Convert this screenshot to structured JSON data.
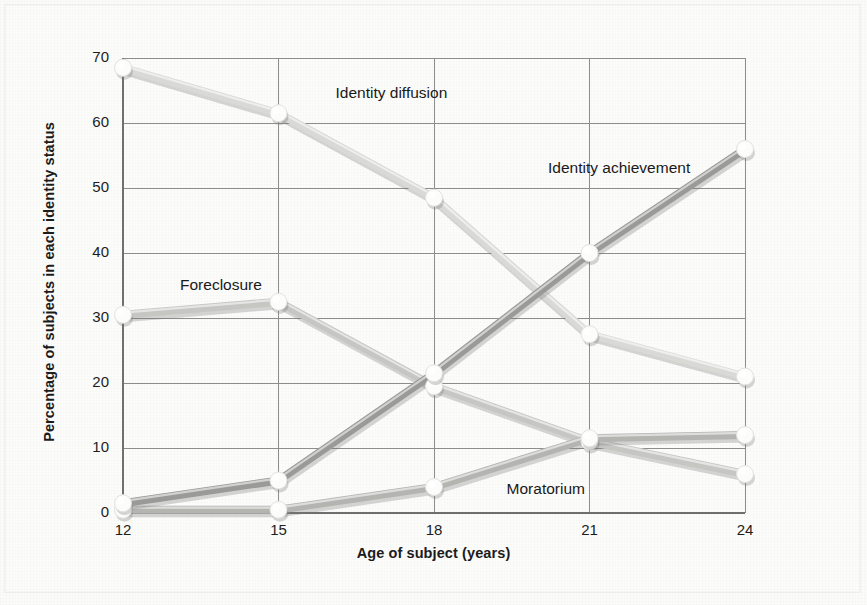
{
  "figure": {
    "background_color": "#fbfbfa",
    "ink_color": "#1b1b1b"
  },
  "axes": {
    "y_title": "Percentage of subjects in each identity status",
    "x_title": "Age of subject (years)",
    "y_ticks": [
      "0",
      "10",
      "20",
      "30",
      "40",
      "50",
      "60",
      "70"
    ],
    "x_ticks": [
      "12",
      "15",
      "18",
      "21",
      "24"
    ]
  },
  "labels": {
    "identity_diffusion": "Identity diffusion",
    "identity_achievement": "Identity achievement",
    "foreclosure": "Foreclosure",
    "moratorium": "Moratorium"
  },
  "chart_data": {
    "type": "line",
    "title": "",
    "xlabel": "Age of subject (years)",
    "ylabel": "Percentage of subjects in each identity status",
    "x": [
      12,
      15,
      18,
      21,
      24
    ],
    "xlim": [
      12,
      24
    ],
    "ylim": [
      0,
      70
    ],
    "yticks": [
      0,
      10,
      20,
      30,
      40,
      50,
      60,
      70
    ],
    "xticks": [
      12,
      15,
      18,
      21,
      24
    ],
    "grid": true,
    "legend": "inline-annotations",
    "markers": "white circle",
    "series": [
      {
        "name": "Identity diffusion",
        "color": "#d9d9d6",
        "values": [
          68.5,
          61.5,
          48.5,
          27.5,
          21.0
        ]
      },
      {
        "name": "Identity achievement",
        "color": "#9a9a99",
        "values": [
          1.5,
          5.0,
          21.5,
          40.0,
          56.0
        ]
      },
      {
        "name": "Foreclosure",
        "color": "#c6c6c3",
        "values": [
          30.5,
          32.5,
          19.5,
          11.0,
          6.0
        ]
      },
      {
        "name": "Moratorium",
        "color": "#b4b4b1",
        "values": [
          0.5,
          0.5,
          4.0,
          11.5,
          12.0
        ]
      }
    ],
    "annotations": [
      {
        "text": "Identity diffusion",
        "x": 16.1,
        "y": 64.5
      },
      {
        "text": "Identity achievement",
        "x": 20.2,
        "y": 53.0
      },
      {
        "text": "Foreclosure",
        "x": 13.1,
        "y": 35.0
      },
      {
        "text": "Moratorium",
        "x": 19.4,
        "y": 3.5
      }
    ]
  }
}
